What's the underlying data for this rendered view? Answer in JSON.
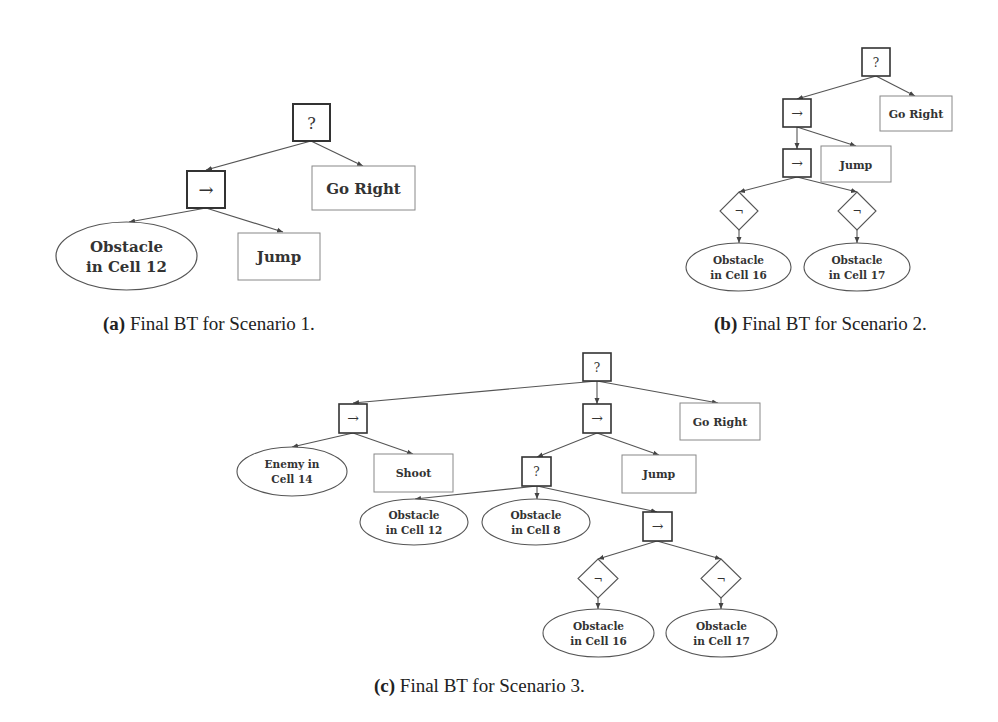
{
  "figures": [
    {
      "id": "a",
      "caption": {
        "letter": "(a)",
        "text": " Final BT for Scenario 1."
      },
      "nodes": {
        "root": {
          "type": "fallback",
          "symbol": "?"
        },
        "seq": {
          "type": "sequence",
          "symbol": "→"
        },
        "go_right": {
          "type": "action",
          "label": "Go Right"
        },
        "cond": {
          "type": "condition",
          "lines": [
            "Obstacle",
            "in Cell 12"
          ]
        },
        "jump": {
          "type": "action",
          "label": "Jump"
        }
      }
    },
    {
      "id": "b",
      "caption": {
        "letter": "(b)",
        "text": " Final BT for Scenario 2."
      },
      "nodes": {
        "root": {
          "type": "fallback",
          "symbol": "?"
        },
        "seq1": {
          "type": "sequence",
          "symbol": "→"
        },
        "go_right": {
          "type": "action",
          "label": "Go Right"
        },
        "seq2": {
          "type": "sequence",
          "symbol": "→"
        },
        "jump": {
          "type": "action",
          "label": "Jump"
        },
        "not1": {
          "type": "inverter",
          "symbol": "¬"
        },
        "not2": {
          "type": "inverter",
          "symbol": "¬"
        },
        "cond16": {
          "type": "condition",
          "lines": [
            "Obstacle",
            "in Cell 16"
          ]
        },
        "cond17": {
          "type": "condition",
          "lines": [
            "Obstacle",
            "in Cell 17"
          ]
        }
      }
    },
    {
      "id": "c",
      "caption": {
        "letter": "(c)",
        "text": " Final BT for Scenario 3."
      },
      "nodes": {
        "root": {
          "type": "fallback",
          "symbol": "?"
        },
        "seq_left": {
          "type": "sequence",
          "symbol": "→"
        },
        "seq_mid": {
          "type": "sequence",
          "symbol": "→"
        },
        "go_right": {
          "type": "action",
          "label": "Go Right"
        },
        "enemy": {
          "type": "condition",
          "lines": [
            "Enemy in",
            "Cell 14"
          ]
        },
        "shoot": {
          "type": "action",
          "label": "Shoot"
        },
        "fallback_inner": {
          "type": "fallback",
          "symbol": "?"
        },
        "jump": {
          "type": "action",
          "label": "Jump"
        },
        "cond12": {
          "type": "condition",
          "lines": [
            "Obstacle",
            "in Cell 12"
          ]
        },
        "cond8": {
          "type": "condition",
          "lines": [
            "Obstacle",
            "in Cell 8"
          ]
        },
        "seq_right": {
          "type": "sequence",
          "symbol": "→"
        },
        "not1": {
          "type": "inverter",
          "symbol": "¬"
        },
        "not2": {
          "type": "inverter",
          "symbol": "¬"
        },
        "cond16": {
          "type": "condition",
          "lines": [
            "Obstacle",
            "in Cell 16"
          ]
        },
        "cond17": {
          "type": "condition",
          "lines": [
            "Obstacle",
            "in Cell 17"
          ]
        }
      }
    }
  ],
  "colors": {
    "stroke": "#444444",
    "light_stroke": "#777777",
    "text": "#333333"
  }
}
